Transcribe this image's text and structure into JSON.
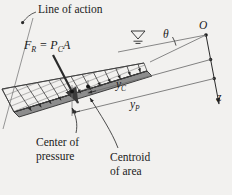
{
  "figure": {
    "background_color": "#f2f1ef",
    "ink_color": "#1b1b1b",
    "line_color": "#6d6d6d"
  },
  "labels": {
    "line_of_action": "Line of action",
    "center_of_pressure_l1": "Center of",
    "center_of_pressure_l2": "pressure",
    "centroid_of_area_l1": "Centroid",
    "centroid_of_area_l2": "of area"
  },
  "symbols": {
    "resultant_force_F": "F",
    "resultant_force_F_sub": "R",
    "equals": " = ",
    "pressure_P": "P",
    "pressure_P_sub": "C",
    "area_A": "A",
    "theta": "θ",
    "origin_O": "O",
    "axis_z": "z",
    "y_centroid": "y",
    "y_centroid_sub": "C",
    "y_pressure": "y",
    "y_pressure_sub": "P"
  },
  "icons": {
    "free_surface": "free-surface-icon",
    "pressure_distribution": "pressure-distribution-icon",
    "axis_arrow": "axis-arrow-icon"
  }
}
